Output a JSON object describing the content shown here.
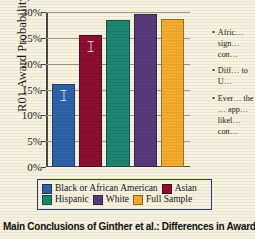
{
  "caption": "Main Conclusions of Ginther et al.: Differences in Award Rates",
  "chart_data": {
    "type": "bar",
    "title": "",
    "xlabel": "",
    "ylabel": "R01 Award Probability",
    "categories": [
      "Black or African American",
      "Asian",
      "Hispanic",
      "White",
      "Full Sample"
    ],
    "values": [
      16.1,
      25.5,
      28.4,
      29.6,
      28.7
    ],
    "value_labels": [
      "16.1%",
      "25.5%",
      "28.4%",
      "29.6%",
      "28.7%"
    ],
    "colors": [
      "#2E62A8",
      "#8C0E30",
      "#1E8570",
      "#59397C",
      "#F2AB2E"
    ],
    "ylim": [
      0,
      30
    ],
    "yticks": [
      0,
      5,
      10,
      15,
      20,
      25,
      30
    ],
    "ytick_labels": [
      "0%",
      "5%",
      "10%",
      "15%",
      "20%",
      "25%",
      "30%"
    ],
    "grid": true,
    "legend_position": "bottom",
    "error_bars": [
      true,
      true,
      false,
      false,
      false
    ]
  },
  "legend": {
    "rows": [
      [
        {
          "label": "Black or African American",
          "color": "#2E62A8"
        },
        {
          "label": "Asian",
          "color": "#8C0E30"
        }
      ],
      [
        {
          "label": "Hispanic",
          "color": "#1E8570"
        },
        {
          "label": "White",
          "color": "#59397C"
        },
        {
          "label": "Full Sample",
          "color": "#F2AB2E"
        }
      ]
    ],
    "border_color": "#2a3b7a"
  },
  "bullets": [
    {
      "marker": "•",
      "text": "Afric… sign… con…"
    },
    {
      "marker": "•",
      "text": "Diff… to U…"
    },
    {
      "marker": "•",
      "text": "Ever… the … app… likel… con…"
    }
  ],
  "theme": {
    "background": "#f7f2de",
    "axis_color": "#4a4a44",
    "grid_color": "#9d9a86",
    "text_color": "#1a1a1a"
  }
}
